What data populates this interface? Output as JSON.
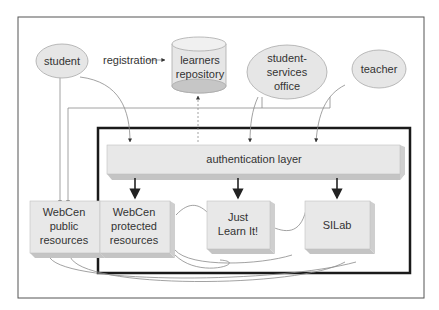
{
  "diagram": {
    "actors": {
      "student": "student",
      "student_services": [
        "student-",
        "services",
        "office"
      ],
      "teacher": "teacher"
    },
    "repository": [
      "learners",
      "repository"
    ],
    "edge_registration": "registration",
    "auth_layer": "authentication layer",
    "boxes": {
      "webcen_public": [
        "WebCen",
        "public",
        "resources"
      ],
      "webcen_protected": [
        "WebCen",
        "protected",
        "resources"
      ],
      "just_learn": [
        "Just",
        "Learn It!"
      ],
      "silab": "SILab"
    },
    "colors": {
      "node_fill": "#e6e6e6",
      "node_stroke": "#b0b0b0",
      "shadow": "#c4c4c4",
      "frame": "#555555",
      "thick_box": "#1a1a1a",
      "text": "#333333"
    }
  }
}
